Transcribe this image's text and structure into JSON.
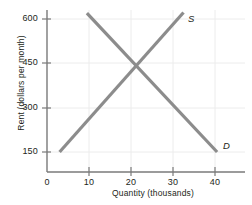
{
  "chart_data": {
    "type": "line",
    "title": "",
    "xlabel": "Quantity (thousands)",
    "ylabel": "Rent (dollars per month)",
    "xlim": [
      0,
      46
    ],
    "ylim": [
      0,
      660
    ],
    "xticks": [
      0,
      10,
      20,
      30,
      40
    ],
    "xtick_labels": [
      "0",
      "10",
      "20",
      "30",
      "40"
    ],
    "yticks": [
      150,
      300,
      450,
      600
    ],
    "ytick_labels": [
      "150",
      "300",
      "450",
      "600"
    ],
    "grid": true,
    "legend": "inline-curve-labels",
    "series": [
      {
        "name": "S",
        "label": "S",
        "description": "Supply curve, upward sloping",
        "color": "#8c8c8c",
        "label_x": 34,
        "label_y": 640,
        "points": [
          {
            "x": 3,
            "y": 150
          },
          {
            "x": 32.5,
            "y": 622
          }
        ]
      },
      {
        "name": "D",
        "label": "D",
        "description": "Demand curve, downward sloping",
        "color": "#8c8c8c",
        "label_x": 42.5,
        "label_y": 168,
        "points": [
          {
            "x": 9.5,
            "y": 620
          },
          {
            "x": 40.5,
            "y": 150
          }
        ]
      }
    ],
    "equilibrium": {
      "x": 20,
      "y": 450
    }
  },
  "colors": {
    "curve": "#8c8c8c",
    "axis": "#7a7a7a",
    "grid": "#e8e8e8",
    "text": "#231f20",
    "background": "#ffffff"
  }
}
